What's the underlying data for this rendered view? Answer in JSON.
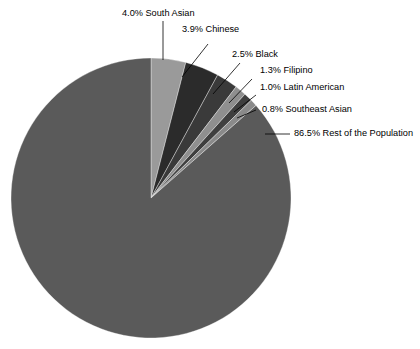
{
  "chart_data": {
    "type": "pie",
    "title": "",
    "subtitle": "",
    "xlabel": "",
    "ylabel": "",
    "legend_position": "none",
    "grid": false,
    "units": "percent",
    "start_angle_deg": 0,
    "direction": "clockwise",
    "categories": [
      "South Asian",
      "Chinese",
      "Black",
      "Filipino",
      "Latin American",
      "Southeast Asian",
      "Rest of the Population"
    ],
    "values": [
      4.0,
      3.9,
      2.5,
      1.3,
      1.0,
      0.8,
      86.5
    ],
    "colors": [
      "#9a9a9a",
      "#2b2b2b",
      "#3a3a3a",
      "#8f8f8f",
      "#3f3f3f",
      "#8a8a8a",
      "#5a5a5a"
    ],
    "slices": [
      {
        "label": "South Asian",
        "value": 4.0,
        "value_text": "4.0%",
        "full_label": "4.0% South Asian",
        "color": "#9a9a9a"
      },
      {
        "label": "Chinese",
        "value": 3.9,
        "value_text": "3.9%",
        "full_label": "3.9% Chinese",
        "color": "#2b2b2b"
      },
      {
        "label": "Black",
        "value": 2.5,
        "value_text": "2.5%",
        "full_label": "2.5% Black",
        "color": "#3a3a3a"
      },
      {
        "label": "Filipino",
        "value": 1.3,
        "value_text": "1.3%",
        "full_label": "1.3% Filipino",
        "color": "#8f8f8f"
      },
      {
        "label": "Latin American",
        "value": 1.0,
        "value_text": "1.0%",
        "full_label": "1.0% Latin American",
        "color": "#3f3f3f"
      },
      {
        "label": "Southeast Asian",
        "value": 0.8,
        "value_text": "0.8%",
        "full_label": "0.8% Southeast Asian",
        "color": "#8a8a8a"
      },
      {
        "label": "Rest of the Population",
        "value": 86.5,
        "value_text": "86.5%",
        "full_label": "86.5% Rest of the Population",
        "color": "#5a5a5a"
      }
    ]
  },
  "labels": {
    "south_asian": "4.0% South Asian",
    "chinese": "3.9% Chinese",
    "black": "2.5% Black",
    "filipino": "1.3% Filipino",
    "latin_american": "1.0% Latin American",
    "southeast_asian": "0.8% Southeast Asian",
    "rest": "86.5% Rest of the Population"
  },
  "geometry": {
    "center_x": 151,
    "center_y": 198,
    "radius": 140
  },
  "colors": {
    "background": "#ffffff",
    "text": "#000000",
    "leader": "#000000"
  }
}
